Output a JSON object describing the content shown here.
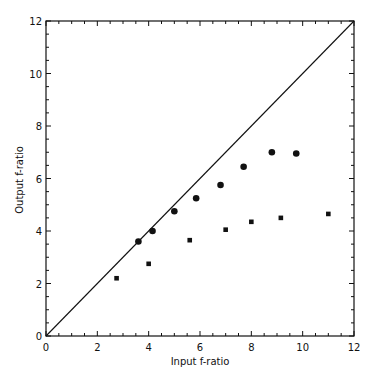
{
  "chart_data": {
    "type": "scatter",
    "title": "",
    "xlabel": "Input f-ratio",
    "ylabel": "Output f-ratio",
    "xlim": [
      0,
      12
    ],
    "ylim": [
      0,
      12
    ],
    "x_ticks": [
      0,
      2,
      4,
      6,
      8,
      10,
      12
    ],
    "y_ticks": [
      0,
      2,
      4,
      6,
      8,
      10,
      12
    ],
    "minor_tick_step": 0.5,
    "grid": false,
    "legend": null,
    "reference_line": {
      "name": "1:1 line",
      "from": [
        0,
        0
      ],
      "to": [
        12,
        12
      ]
    },
    "series": [
      {
        "name": "circles",
        "marker": "circle",
        "points": [
          {
            "x": 3.6,
            "y": 3.6
          },
          {
            "x": 4.15,
            "y": 4.0
          },
          {
            "x": 5.0,
            "y": 4.75
          },
          {
            "x": 5.85,
            "y": 5.25
          },
          {
            "x": 6.8,
            "y": 5.75
          },
          {
            "x": 7.7,
            "y": 6.45
          },
          {
            "x": 8.8,
            "y": 7.0
          },
          {
            "x": 9.75,
            "y": 6.95
          }
        ]
      },
      {
        "name": "squares",
        "marker": "square",
        "points": [
          {
            "x": 2.75,
            "y": 2.2
          },
          {
            "x": 4.0,
            "y": 2.75
          },
          {
            "x": 5.6,
            "y": 3.65
          },
          {
            "x": 7.0,
            "y": 4.05
          },
          {
            "x": 8.0,
            "y": 4.35
          },
          {
            "x": 9.15,
            "y": 4.5
          },
          {
            "x": 11.0,
            "y": 4.65
          }
        ]
      }
    ]
  },
  "colors": {
    "ink": "#111111",
    "background": "#ffffff"
  }
}
